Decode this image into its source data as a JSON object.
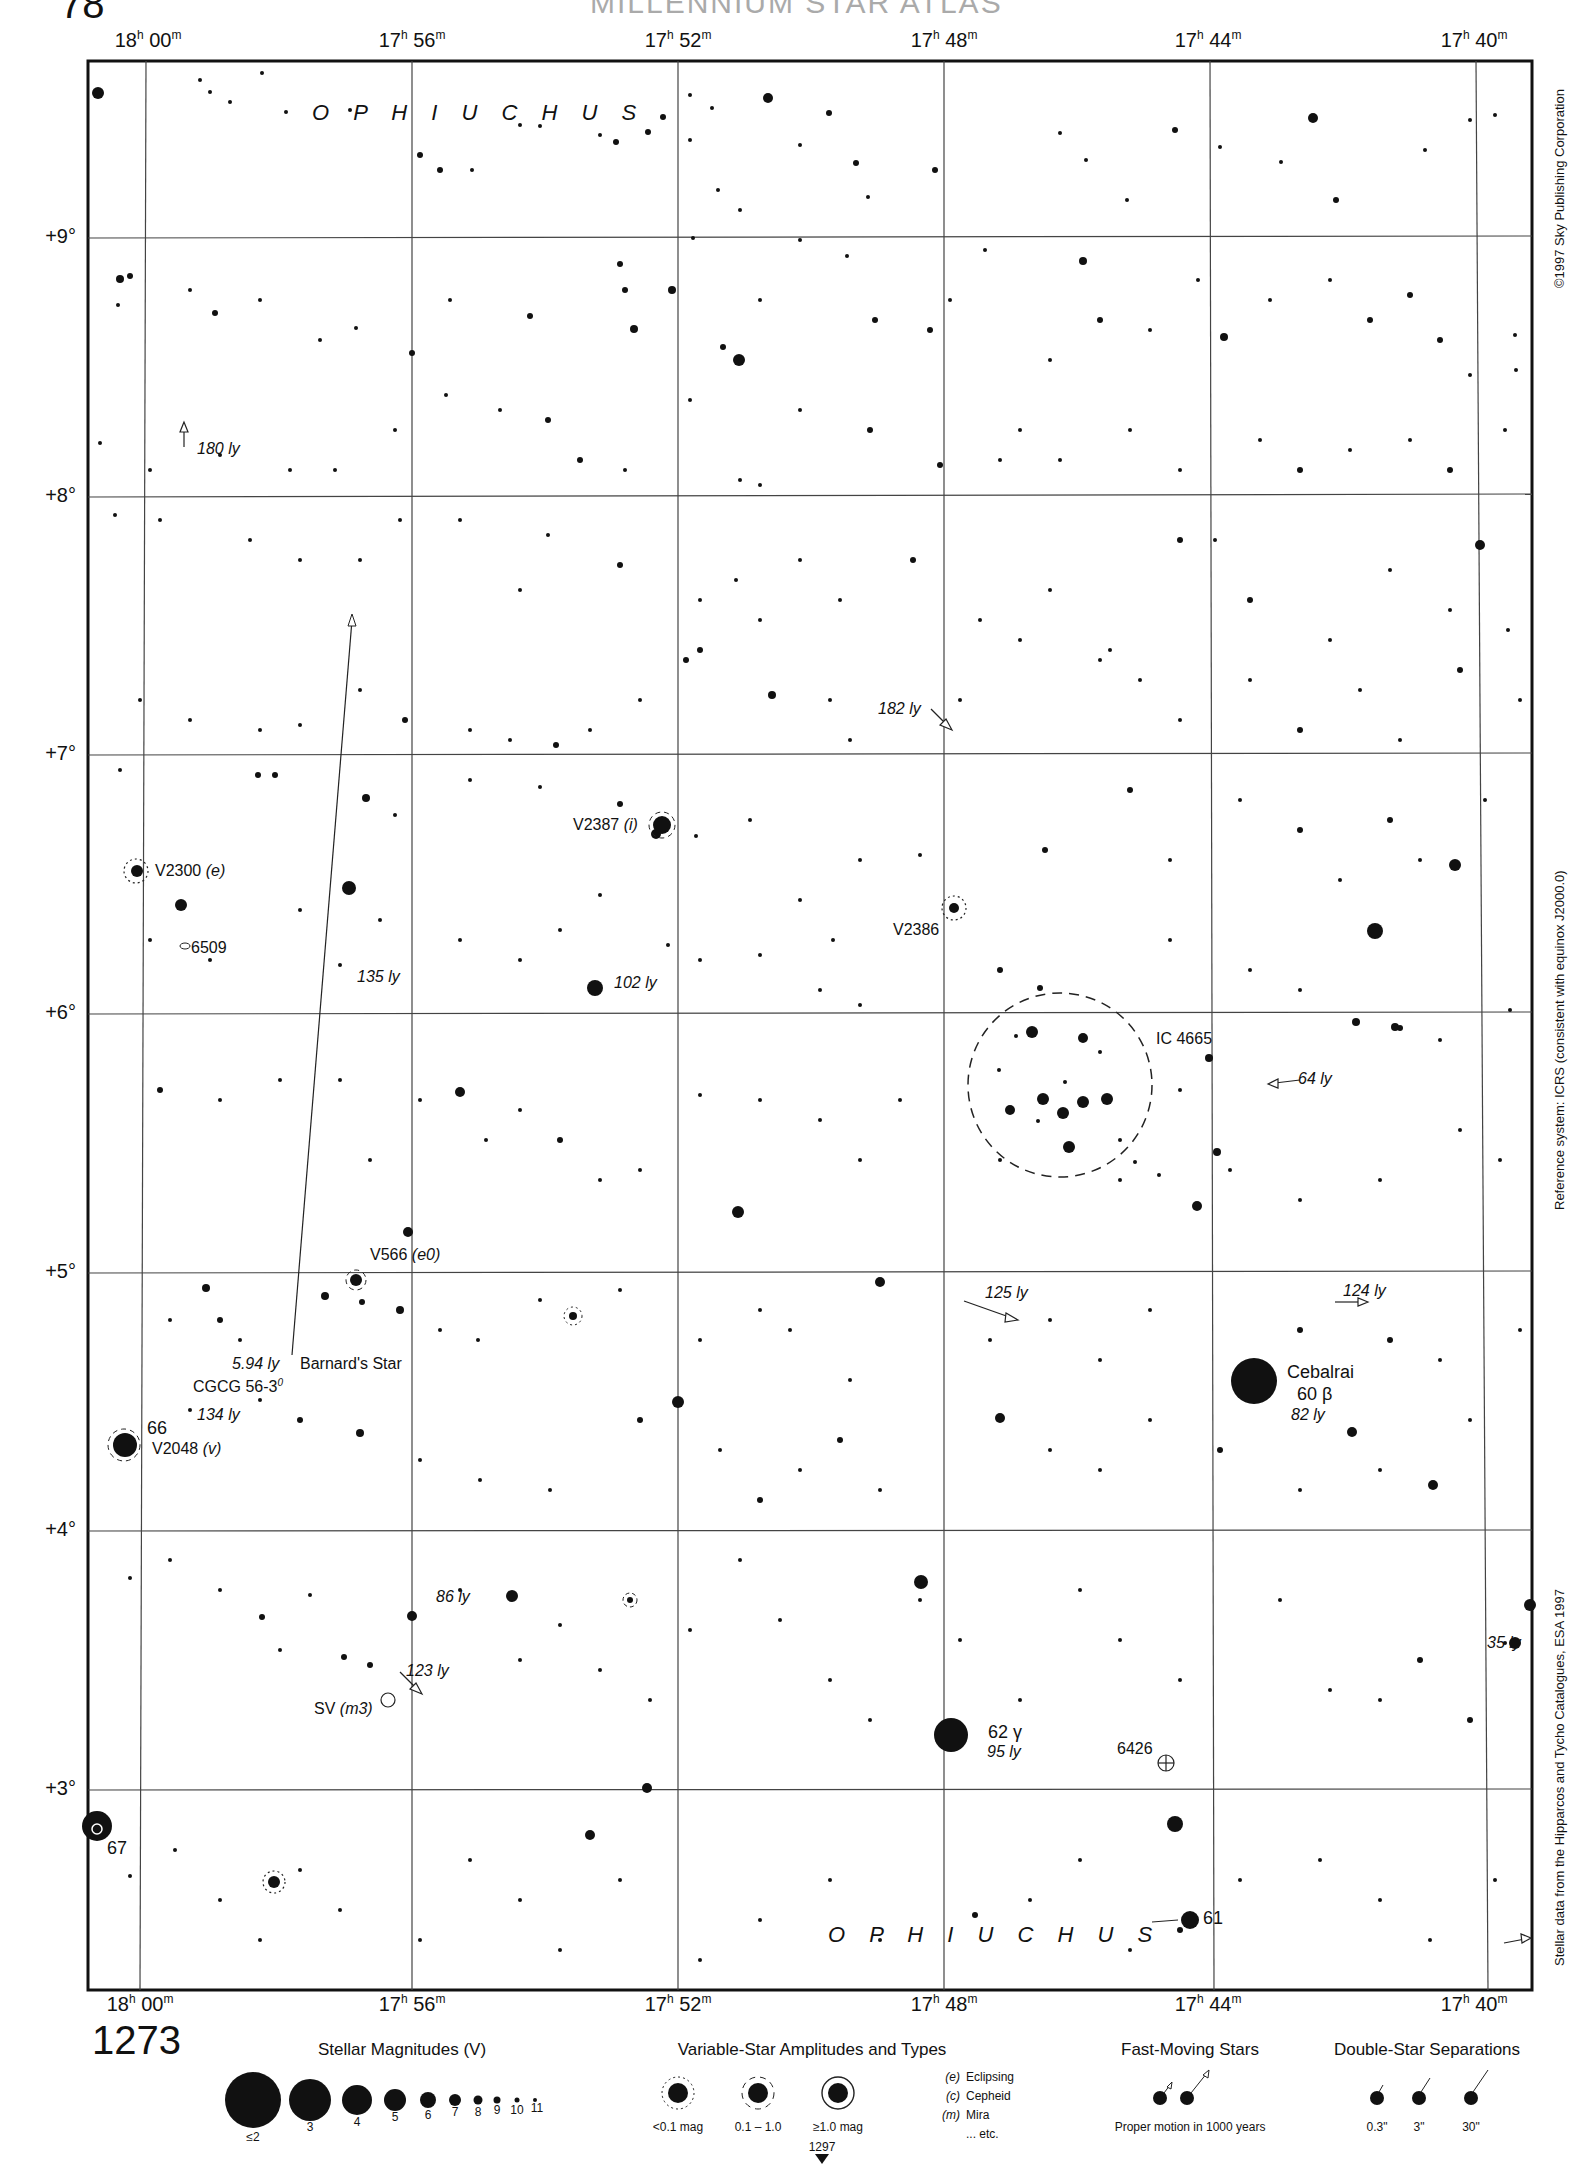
{
  "header": {
    "page_number": "1273",
    "atlas_page_top_left": "78",
    "title_faint": "MILLENNIUM STAR ATLAS"
  },
  "axes": {
    "ra_labels": [
      {
        "h": "18",
        "m": "00",
        "x": 148
      },
      {
        "h": "17",
        "m": "56",
        "x": 412
      },
      {
        "h": "17",
        "m": "52",
        "x": 678
      },
      {
        "h": "17",
        "m": "48",
        "x": 944
      },
      {
        "h": "17",
        "m": "44",
        "x": 1208
      },
      {
        "h": "17",
        "m": "40",
        "x": 1474
      }
    ],
    "dec_labels": [
      {
        "label": "+9°",
        "y": 237
      },
      {
        "label": "+8°",
        "y": 496
      },
      {
        "label": "+7°",
        "y": 754
      },
      {
        "label": "+6°",
        "y": 1013
      },
      {
        "label": "+5°",
        "y": 1272
      },
      {
        "label": "+4°",
        "y": 1530
      },
      {
        "label": "+3°",
        "y": 1789
      }
    ]
  },
  "constellation": {
    "top_label": "O P H I U C H U S",
    "bottom_label": "O P H I U C H U S"
  },
  "side_notes": {
    "copyright": "©1997 Sky Publishing Corporation",
    "reference_system": "Reference system: ICRS (consistent with equinox J2000.0)",
    "data_source": "Stellar data from the Hipparcos and Tycho Catalogues, ESA 1997"
  },
  "labels": {
    "v2300": "V2300",
    "v2300_type": "(e)",
    "ngc6509": "6509",
    "ly135": "135 ly",
    "ly180": "180 ly",
    "v2387": "V2387",
    "v2387_type": "(i)",
    "ly102": "102 ly",
    "v2386": "V2386",
    "ly182": "182 ly",
    "ic4665": "IC 4665",
    "ly64": "64 ly",
    "v566": "V566",
    "v566_type": "(e0)",
    "ly594": "5.94 ly",
    "barnard": "Barnard's Star",
    "cgcg": "CGCG 56-3",
    "cgcg_sup": "0",
    "ly134": "134 ly",
    "star66": "66",
    "v2048": "V2048",
    "v2048_type": "(v)",
    "ly125": "125 ly",
    "ly124": "124 ly",
    "cebalrai": "Cebalrai",
    "cebalrai_desig": "60 β",
    "ly82": "82 ly",
    "ly86": "86 ly",
    "ly123": "123 ly",
    "sv": "SV",
    "sv_type": "(m3)",
    "ly35": "35 ly",
    "ngc6426": "6426",
    "star67": "67",
    "star62": "62 γ",
    "ly95": "95 ly",
    "star61": "61"
  },
  "legend": {
    "chart_number": "1273",
    "magnitudes": {
      "title": "Stellar Magnitudes (V)",
      "items": [
        "≤2",
        "3",
        "4",
        "5",
        "6",
        "7",
        "8",
        "9",
        "10",
        "11"
      ]
    },
    "variables": {
      "title": "Variable-Star Amplitudes and Types",
      "amplitudes": [
        "<0.1 mag",
        "0.1 – 1.0",
        "≥1.0 mag"
      ],
      "types": [
        {
          "code": "(e)",
          "name": "Eclipsing"
        },
        {
          "code": "(c)",
          "name": "Cepheid"
        },
        {
          "code": "(m)",
          "name": "Mira"
        },
        {
          "code": "",
          "name": "... etc."
        }
      ],
      "next_chart": "1297"
    },
    "fast_moving": {
      "title": "Fast-Moving Stars",
      "caption": "Proper motion in 1000 years"
    },
    "doubles": {
      "title": "Double-Star Separations",
      "items": [
        "0.3\"",
        "3\"",
        "30\""
      ]
    }
  }
}
